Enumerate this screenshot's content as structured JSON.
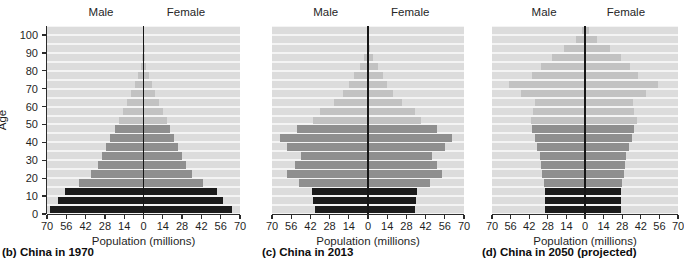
{
  "figure": {
    "axis_title_x": "Population (millions)",
    "axis_title_y": "Age",
    "male_label": "Male",
    "female_label": "Female",
    "x_ticks": [
      "70",
      "56",
      "42",
      "28",
      "14",
      "0",
      "14",
      "28",
      "42",
      "56",
      "70"
    ],
    "y_ticks": [
      "0",
      "10",
      "20",
      "30",
      "40",
      "50",
      "60",
      "70",
      "80",
      "90",
      "100"
    ],
    "colors": {
      "plot_background": "#dcdcdc",
      "gridline": "#f4f4f4",
      "bar_young": "#1c1c1c",
      "bar_middle": "#8f8f8f",
      "bar_old": "#c2c2c2",
      "axis": "#2b2b2b",
      "center_line": "#161616"
    }
  },
  "chart_data": [
    {
      "type": "bar",
      "title": "(b) China in 1970",
      "panel_letter": "(b)",
      "xlabel": "Population (millions)",
      "ylabel": "Age",
      "xlim": [
        -70,
        70
      ],
      "ylim": [
        0,
        105
      ],
      "xtick_values": [
        -70,
        -56,
        -42,
        -28,
        -14,
        0,
        14,
        28,
        42,
        56,
        70
      ],
      "ytick_values": [
        0,
        10,
        20,
        30,
        40,
        50,
        60,
        70,
        80,
        90,
        100
      ],
      "grid": true,
      "age_groups": [
        "0-4",
        "5-9",
        "10-14",
        "15-19",
        "20-24",
        "25-29",
        "30-34",
        "35-39",
        "40-44",
        "45-49",
        "50-54",
        "55-59",
        "60-64",
        "65-69",
        "70-74",
        "75-79",
        "80-84",
        "85-89",
        "90-94",
        "95-99",
        "100+"
      ],
      "series": [
        {
          "name": "Male",
          "values": [
            68,
            62,
            57,
            47,
            38,
            33,
            30,
            27,
            24,
            21,
            18,
            15,
            12,
            9,
            6,
            4,
            2,
            1,
            0.4,
            0.1,
            0.02
          ]
        },
        {
          "name": "Female",
          "values": [
            64,
            58,
            53,
            43,
            35,
            31,
            28,
            25,
            22,
            19,
            17,
            14,
            11,
            8,
            6,
            4,
            2,
            1,
            0.4,
            0.1,
            0.02
          ]
        }
      ],
      "cohort_color_groups": {
        "young": "0-14",
        "middle": "15-49",
        "old": "50+"
      }
    },
    {
      "type": "bar",
      "title": "(c) China in 2013",
      "panel_letter": "(c)",
      "xlabel": "Population (millions)",
      "ylabel": "Age",
      "xlim": [
        -70,
        70
      ],
      "ylim": [
        0,
        105
      ],
      "xtick_values": [
        -70,
        -56,
        -42,
        -28,
        -14,
        0,
        14,
        28,
        42,
        56,
        70
      ],
      "ytick_values": [
        0,
        10,
        20,
        30,
        40,
        50,
        60,
        70,
        80,
        90,
        100
      ],
      "grid": true,
      "age_groups": [
        "0-4",
        "5-9",
        "10-14",
        "15-19",
        "20-24",
        "25-29",
        "30-34",
        "35-39",
        "40-44",
        "45-49",
        "50-54",
        "55-59",
        "60-64",
        "65-69",
        "70-74",
        "75-79",
        "80-84",
        "85-89",
        "90-94",
        "95-99",
        "100+"
      ],
      "series": [
        {
          "name": "Male",
          "values": [
            39,
            40,
            41,
            50,
            59,
            53,
            49,
            59,
            64,
            52,
            40,
            35,
            25,
            18,
            14,
            10,
            6,
            3,
            1,
            0.3,
            0.05
          ]
        },
        {
          "name": "Female",
          "values": [
            34,
            35,
            36,
            45,
            54,
            50,
            47,
            56,
            61,
            50,
            39,
            34,
            25,
            18,
            14,
            11,
            7,
            4,
            1.5,
            0.4,
            0.07
          ]
        }
      ],
      "cohort_color_groups": {
        "young": "0-14",
        "middle": "15-49",
        "old": "50+"
      }
    },
    {
      "type": "bar",
      "title": "(d) China in 2050 (projected)",
      "panel_letter": "(d)",
      "xlabel": "Population (millions)",
      "ylabel": "Age",
      "xlim": [
        -70,
        70
      ],
      "ylim": [
        0,
        105
      ],
      "xtick_values": [
        -70,
        -56,
        -42,
        -28,
        -14,
        0,
        14,
        28,
        42,
        56,
        70
      ],
      "ytick_values": [
        0,
        10,
        20,
        30,
        40,
        50,
        60,
        70,
        80,
        90,
        100
      ],
      "grid": true,
      "age_groups": [
        "0-4",
        "5-9",
        "10-14",
        "15-19",
        "20-24",
        "25-29",
        "30-34",
        "35-39",
        "40-44",
        "45-49",
        "50-54",
        "55-59",
        "60-64",
        "65-69",
        "70-74",
        "75-79",
        "80-84",
        "85-89",
        "90-94",
        "95-99",
        "100+"
      ],
      "series": [
        {
          "name": "Male",
          "values": [
            30,
            30,
            30,
            31,
            32,
            33,
            34,
            36,
            38,
            40,
            41,
            39,
            38,
            48,
            57,
            40,
            33,
            25,
            16,
            7,
            2
          ]
        },
        {
          "name": "Female",
          "values": [
            27,
            27,
            27,
            28,
            29,
            30,
            31,
            33,
            35,
            37,
            39,
            37,
            36,
            46,
            55,
            40,
            34,
            27,
            19,
            9,
            3
          ]
        }
      ],
      "cohort_color_groups": {
        "young": "0-14",
        "middle": "15-49",
        "old": "50+"
      }
    }
  ]
}
